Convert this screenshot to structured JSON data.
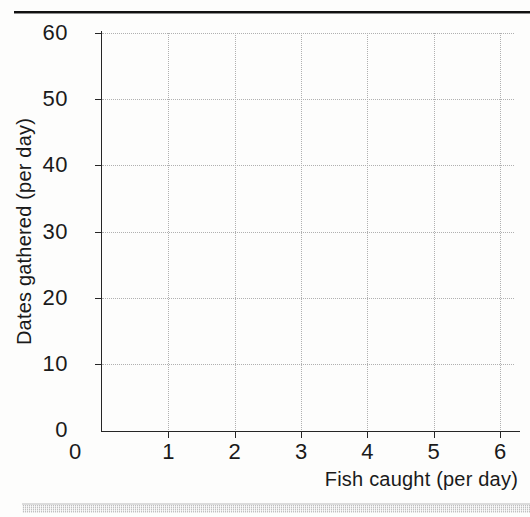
{
  "chart_data": {
    "type": "scatter",
    "title": "",
    "xlabel": "Fish caught (per day)",
    "ylabel": "Dates gathered (per day)",
    "xlim": [
      0,
      6
    ],
    "ylim": [
      0,
      60
    ],
    "xticks": [
      0,
      1,
      2,
      3,
      4,
      5,
      6
    ],
    "yticks": [
      0,
      10,
      20,
      30,
      40,
      50,
      60
    ],
    "xtick_labels": [
      "0",
      "1",
      "2",
      "3",
      "4",
      "5",
      "6"
    ],
    "ytick_labels": [
      "0",
      "10",
      "20",
      "30",
      "40",
      "50",
      "60"
    ],
    "grid": true,
    "grid_style": "dotted",
    "legend": null,
    "series": [],
    "values": [],
    "annotations": [],
    "note": "empty plotting grid; no data points are drawn"
  },
  "figure": {
    "background_color": "#fdfdfc",
    "axis_color": "#262626",
    "grid_color": "#b0b0b0",
    "text_color": "#1a1a1a",
    "rule_color": "#111111",
    "band_color": "#b9b9b9"
  }
}
